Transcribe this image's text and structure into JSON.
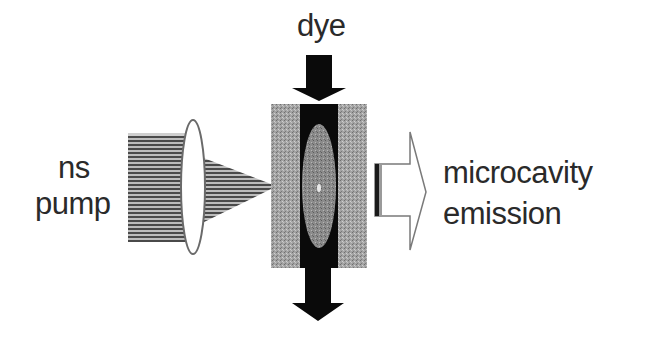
{
  "diagram": {
    "labels": {
      "dye": "dye",
      "pump_line1": "ns",
      "pump_line2": "pump",
      "emission_line1": "microcavity",
      "emission_line2": "emission"
    },
    "components": [
      {
        "id": "pump-beam",
        "description": "ns pump beam (hatched)"
      },
      {
        "id": "lens",
        "description": "focusing lens"
      },
      {
        "id": "focus-cone",
        "description": "focused pump cone"
      },
      {
        "id": "left-mirror",
        "description": "microcavity mirror (left)"
      },
      {
        "id": "dye-channel",
        "description": "dye flow channel"
      },
      {
        "id": "gain-region",
        "description": "excited region in dye"
      },
      {
        "id": "right-mirror",
        "description": "microcavity mirror (right)"
      },
      {
        "id": "dye-in-arrow",
        "description": "dye flow in (down)"
      },
      {
        "id": "dye-out-arrow",
        "description": "dye flow out (down)"
      },
      {
        "id": "emission-arrow",
        "description": "microcavity emission output"
      }
    ],
    "colors": {
      "black": "#0a0a0a",
      "mirror": "#9a9a9a",
      "gain": "#8a8a8a",
      "beam": "#6e6e6e",
      "text": "#2a2a2a"
    }
  }
}
